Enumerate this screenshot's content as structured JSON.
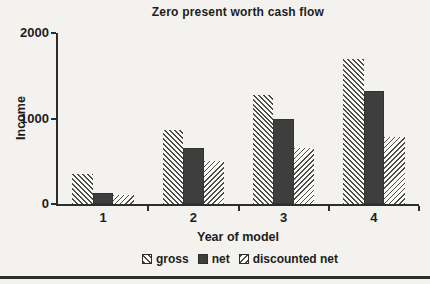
{
  "figure": {
    "title": "Zero present worth cash flow"
  },
  "chart_data": {
    "type": "bar",
    "title": "Zero present worth cash flow",
    "categories": [
      "1",
      "2",
      "3",
      "4"
    ],
    "series": [
      {
        "name": "gross",
        "pattern": "diagonal-hatch-backslash",
        "values": [
          350,
          860,
          1270,
          1700
        ]
      },
      {
        "name": "net",
        "pattern": "solid-dark",
        "values": [
          130,
          660,
          990,
          1320
        ]
      },
      {
        "name": "discounted net",
        "pattern": "diagonal-hatch-slash",
        "values": [
          110,
          500,
          650,
          780
        ]
      }
    ],
    "xlabel": "Year of model",
    "ylabel": "Income",
    "ylim": [
      0,
      2000
    ],
    "yticks": [
      0,
      1000,
      2000
    ],
    "grid": false,
    "legend_position": "bottom",
    "legend_labels": [
      "gross",
      "net",
      "discounted net"
    ]
  },
  "colors": {
    "background": "#f3f2ee",
    "axis": "#2d2d2d",
    "text": "#1d1d1d",
    "solid_bar": "#3e3e3e",
    "hatch_stripe": "#4c4c4c",
    "hatch_background": "#fbfaf7",
    "rule": "#2d2d2d"
  }
}
